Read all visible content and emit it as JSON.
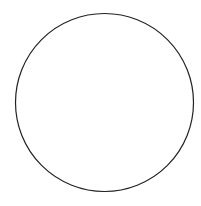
{
  "figure": {
    "caption": "Fig.3",
    "sphere": {
      "cx": 104.5,
      "cy": 102.5,
      "r": 89
    },
    "meridians": [
      {
        "x_equator": 36,
        "color": "#aaaaaa"
      },
      {
        "x_equator": 54,
        "color": "#222222"
      },
      {
        "x_equator": 80,
        "color": "#aaaaaa"
      },
      {
        "x_equator": 104.5,
        "color": "#222222"
      },
      {
        "x_equator": 129,
        "color": "#aaaaaa"
      },
      {
        "x_equator": 154,
        "color": "#222222"
      },
      {
        "x_equator": 173,
        "color": "#aaaaaa"
      }
    ],
    "chevron_color": "#dddddd",
    "outline_color": "#222222"
  }
}
